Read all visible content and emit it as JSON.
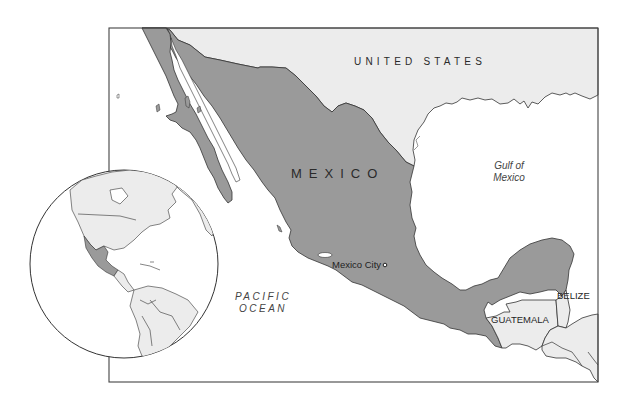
{
  "map": {
    "title_region": "Mexico",
    "colors": {
      "mexico_fill": "#9a9a9a",
      "neighbor_fill": "#ececec",
      "water_fill": "#ffffff",
      "border_stroke": "#333333",
      "frame_stroke": "#444444"
    },
    "labels": {
      "united_states": "UNITED STATES",
      "mexico": "MEXICO",
      "gulf_line1": "Gulf of",
      "gulf_line2": "Mexico",
      "pacific_line1": "PACIFIC",
      "pacific_line2": "OCEAN",
      "mexico_city": "Mexico City",
      "guatemala": "GUATEMALA",
      "belize": "BELIZE"
    },
    "locator_globe": {
      "description": "Orthographic globe of the Americas with Mexico highlighted",
      "highlighted_country": "Mexico"
    },
    "capital_marker": "open-circle"
  }
}
